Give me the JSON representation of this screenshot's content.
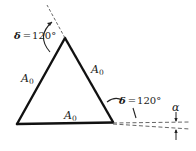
{
  "diagram": {
    "title": "",
    "sides": {
      "left": {
        "label": "A",
        "subscript": "0"
      },
      "right": {
        "label": "A",
        "subscript": "0"
      },
      "bottom": {
        "label": "A",
        "subscript": "0"
      }
    },
    "angles": {
      "apex": {
        "symbol": "δ",
        "equals": "=",
        "value": "120°"
      },
      "bottom_right": {
        "symbol": "δ",
        "equals": "=",
        "value": "120°"
      }
    },
    "deviation": {
      "symbol": "α"
    },
    "colors": {
      "line": "#111111",
      "dashed": "#555555",
      "text": "#1a1a1a",
      "background": "#ffffff"
    }
  }
}
